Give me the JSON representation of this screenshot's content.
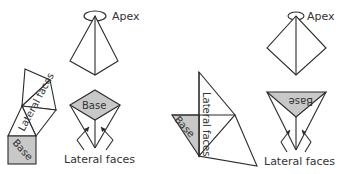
{
  "figure": {
    "left_panel": {
      "shape": "square-based pyramid",
      "apex_label": "Apex",
      "net_base_label": "Base",
      "net_lateral_label": "Lateral faces",
      "assembled_base_label": "Base",
      "assembled_lateral_label": "Lateral faces",
      "colors": {
        "base_fill": "#c8c8c8",
        "stroke": "#2a2a2a"
      }
    },
    "right_panel": {
      "shape": "triangular-based pyramid",
      "apex_label": "Apex",
      "net_base_label": "Base",
      "net_lateral_label": "Lateral faces",
      "assembled_base_label": "Base",
      "assembled_lateral_label": "Lateral faces",
      "colors": {
        "base_fill": "#c8c8c8",
        "stroke": "#2a2a2a"
      }
    }
  }
}
